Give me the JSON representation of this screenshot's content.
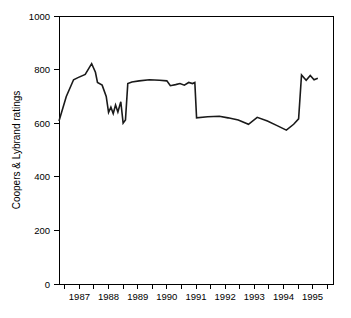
{
  "chart_data": {
    "type": "line",
    "title": "",
    "subtitle": "",
    "xlabel": "",
    "ylabel": "Coopers & Lybrand ratings",
    "xlim": [
      1986.3,
      1995.7
    ],
    "ylim": [
      0,
      1000
    ],
    "grid": false,
    "legend": null,
    "y_ticks": [
      0,
      200,
      400,
      600,
      800,
      1000
    ],
    "y_tick_labels": [
      "0",
      "200",
      "400",
      "600",
      "800",
      "1000"
    ],
    "x_ticks": [
      1986.5,
      1987,
      1987.5,
      1988,
      1988.5,
      1989,
      1989.5,
      1990,
      1990.5,
      1991,
      1991.5,
      1992,
      1992.5,
      1993,
      1993.5,
      1994,
      1994.5,
      1995,
      1995.5
    ],
    "x_tick_labels": [
      "",
      "1987",
      "",
      "1988",
      "",
      "1989",
      "",
      "1990",
      "",
      "1991",
      "",
      "1992",
      "",
      "1993",
      "",
      "1994",
      "",
      "1995",
      ""
    ],
    "x_labeled_ticks": [
      1987,
      1988,
      1989,
      1990,
      1991,
      1992,
      1993,
      1994,
      1995
    ],
    "line_color": "#1a1a1a",
    "axis_color": "#000000",
    "background_color": "#ffffff",
    "series": [
      {
        "name": "Coopers & Lybrand ratings",
        "x": [
          1986.3,
          1986.55,
          1986.8,
          1986.95,
          1987.2,
          1987.42,
          1987.55,
          1987.62,
          1987.78,
          1987.92,
          1988.0,
          1988.08,
          1988.16,
          1988.24,
          1988.32,
          1988.42,
          1988.5,
          1988.58,
          1988.66,
          1988.8,
          1989.05,
          1989.4,
          1989.75,
          1990.0,
          1990.12,
          1990.3,
          1990.45,
          1990.6,
          1990.75,
          1990.88,
          1990.96,
          1991.02,
          1991.4,
          1991.8,
          1992.1,
          1992.45,
          1992.8,
          1993.1,
          1993.45,
          1993.8,
          1994.1,
          1994.35,
          1994.52,
          1994.62,
          1994.78,
          1994.92,
          1995.05,
          1995.18
        ],
        "y": [
          608,
          700,
          762,
          770,
          782,
          822,
          790,
          752,
          742,
          700,
          640,
          660,
          636,
          668,
          642,
          680,
          600,
          612,
          748,
          754,
          758,
          762,
          760,
          758,
          740,
          744,
          748,
          742,
          752,
          748,
          752,
          620,
          624,
          626,
          620,
          612,
          596,
          622,
          608,
          590,
          574,
          596,
          616,
          780,
          760,
          778,
          762,
          768
        ]
      }
    ],
    "annotations": []
  },
  "figure": {
    "plot_area": {
      "left": 59,
      "top": 16,
      "right": 333,
      "bottom": 284
    }
  }
}
